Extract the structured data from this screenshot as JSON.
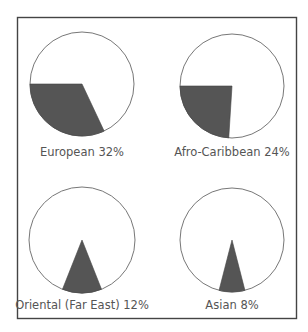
{
  "chart_data": {
    "type": "pie",
    "title": "",
    "panels": [
      {
        "label": "European 32%",
        "category": "European",
        "value": 32,
        "unit": "%"
      },
      {
        "label": "Afro-Caribbean 24%",
        "category": "Afro-Caribbean",
        "value": 24,
        "unit": "%"
      },
      {
        "label": "Oriental (Far East) 12%",
        "category": "Oriental (Far East)",
        "value": 12,
        "unit": "%"
      },
      {
        "label": "Asian 8%",
        "category": "Asian",
        "value": 8,
        "unit": "%"
      }
    ],
    "colors": {
      "wedge": "#555555",
      "circle_stroke": "#777777",
      "frame": "#444444",
      "label": "#555555"
    }
  }
}
